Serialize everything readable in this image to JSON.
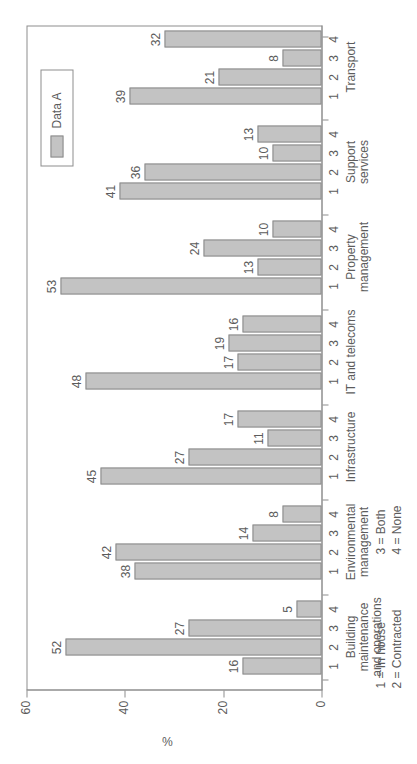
{
  "chart_data": {
    "type": "bar",
    "orientation": "vertical-grouped",
    "title": "",
    "xlabel": "",
    "ylabel": "%",
    "ylim": [
      0,
      60
    ],
    "yticks": [
      0,
      20,
      40,
      60
    ],
    "grid": false,
    "legend": {
      "position": "top-right",
      "entries": [
        "Data A"
      ]
    },
    "series": [
      {
        "name": "Data A",
        "color": "#c3c3c3"
      }
    ],
    "subcategories": [
      "1",
      "2",
      "3",
      "4"
    ],
    "subcategory_key": [
      "1 = In house",
      "2 = Contracted",
      "3 = Both",
      "4 = None"
    ],
    "categories": [
      "Building\nmaintenance\nand operations",
      "Environmental\nmanagement",
      "Infrastructure",
      "IT and telecoms",
      "Property\nmanagement",
      "Support\nservices",
      "Transport"
    ],
    "groups": [
      {
        "category": "Building maintenance and operations",
        "values": [
          16,
          52,
          27,
          5
        ]
      },
      {
        "category": "Environmental management",
        "values": [
          38,
          42,
          14,
          8
        ]
      },
      {
        "category": "Infrastructure",
        "values": [
          45,
          27,
          11,
          17
        ]
      },
      {
        "category": "IT and telecoms",
        "values": [
          48,
          17,
          19,
          16
        ]
      },
      {
        "category": "Property management",
        "values": [
          53,
          13,
          24,
          10
        ]
      },
      {
        "category": "Support services",
        "values": [
          41,
          36,
          10,
          13
        ]
      },
      {
        "category": "Transport",
        "values": [
          39,
          21,
          8,
          32
        ]
      }
    ]
  },
  "axis": {
    "y_label": "%",
    "y_tick_labels": [
      "0",
      "20",
      "40",
      "60"
    ]
  },
  "legend": {
    "label": "Data A"
  },
  "key": {
    "column1": "1 = In house\n2 = Contracted",
    "column2": "3 = Both\n4 = None"
  },
  "colors": {
    "bar_fill": "#c3c3c3",
    "bar_stroke": "#8a8a8a",
    "axis": "#8d8d8d",
    "text": "#5c5c5c",
    "background": "#ffffff"
  }
}
